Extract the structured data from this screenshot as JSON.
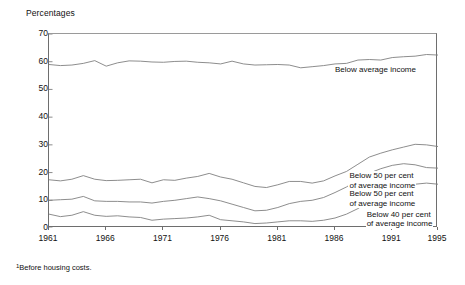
{
  "axis_title": "Percentages",
  "footnote_marker": "1",
  "footnote": "Before housing costs.",
  "labels": {
    "below_average": "Below average income",
    "below_50_upper_l1": "Below 50 per cent",
    "below_50_upper_l2": "of average income",
    "below_50_mid_l1": "Below 50 per cent",
    "below_50_mid_l2": "of average income",
    "below_40_l1": "Below 40 per cent",
    "below_40_l2": "of average income"
  },
  "chart_data": {
    "type": "line",
    "title": "Percentages",
    "xlabel": "",
    "ylabel": "Percentages",
    "xlim": [
      1961,
      1995
    ],
    "ylim": [
      0,
      70
    ],
    "yticks": [
      0,
      10,
      20,
      30,
      40,
      50,
      60,
      70
    ],
    "xticks": [
      1961,
      1966,
      1971,
      1976,
      1981,
      1986,
      1991,
      1995
    ],
    "xticklabels": [
      "1961",
      "1966",
      "1971",
      "1976",
      "1981",
      "1986",
      "1991",
      "1995"
    ],
    "yticklabels": [
      "0",
      "10",
      "20",
      "30",
      "40",
      "50",
      "60",
      "70"
    ],
    "grid": false,
    "legend": "inline-right-labels",
    "line_color": "#808080",
    "x": [
      1961,
      1962,
      1963,
      1964,
      1965,
      1966,
      1967,
      1968,
      1969,
      1970,
      1971,
      1972,
      1973,
      1974,
      1975,
      1976,
      1977,
      1978,
      1979,
      1980,
      1981,
      1982,
      1983,
      1984,
      1985,
      1986,
      1987,
      1988,
      1989,
      1990,
      1991,
      1992,
      1993,
      1994,
      1995
    ],
    "series": [
      {
        "name": "Below average income",
        "label_lines": [
          "Below average income"
        ],
        "values": [
          59.0,
          58.6,
          58.8,
          59.4,
          60.4,
          58.4,
          59.6,
          60.3,
          60.2,
          59.9,
          59.8,
          60.1,
          60.2,
          59.8,
          59.6,
          59.2,
          60.2,
          59.2,
          58.8,
          58.9,
          59.0,
          58.8,
          57.8,
          58.2,
          58.6,
          59.2,
          59.4,
          60.6,
          60.8,
          60.6,
          61.5,
          61.8,
          62.0,
          62.6,
          62.4
        ]
      },
      {
        "name": "Below 50 per cent of average income (upper)",
        "label_lines": [
          "Below 50 per cent",
          "of average income"
        ],
        "values": [
          17.4,
          17.0,
          17.6,
          18.9,
          17.6,
          17.1,
          17.2,
          17.4,
          17.6,
          16.3,
          17.4,
          17.2,
          18.0,
          18.6,
          19.7,
          18.4,
          17.6,
          16.3,
          15.0,
          14.6,
          15.6,
          16.8,
          16.8,
          16.2,
          17.0,
          18.8,
          20.4,
          23.0,
          25.6,
          27.0,
          28.2,
          29.2,
          30.2,
          30.0,
          29.4
        ]
      },
      {
        "name": "Below 50 per cent of average income (middle)",
        "label_lines": [
          "Below 50 per cent",
          "of average income"
        ],
        "values": [
          10.0,
          10.2,
          10.4,
          11.4,
          9.8,
          9.6,
          9.6,
          9.4,
          9.4,
          9.0,
          9.6,
          10.0,
          10.6,
          11.2,
          10.6,
          9.8,
          8.6,
          7.4,
          6.2,
          6.4,
          7.4,
          8.8,
          9.6,
          10.0,
          11.0,
          12.8,
          14.8,
          17.4,
          19.8,
          21.4,
          22.6,
          23.2,
          22.8,
          21.8,
          21.6
        ]
      },
      {
        "name": "Below 40 per cent of average income",
        "label_lines": [
          "Below 40 per cent",
          "of average income"
        ],
        "values": [
          5.0,
          4.1,
          4.6,
          5.9,
          4.6,
          4.2,
          4.4,
          4.0,
          3.8,
          2.8,
          3.2,
          3.4,
          3.6,
          4.0,
          4.6,
          3.0,
          2.6,
          2.2,
          1.6,
          1.8,
          2.2,
          2.6,
          2.6,
          2.4,
          2.8,
          3.6,
          5.0,
          7.0,
          9.6,
          11.6,
          13.0,
          14.2,
          15.8,
          16.2,
          15.8
        ]
      }
    ]
  }
}
